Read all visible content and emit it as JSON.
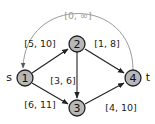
{
  "graph": {
    "nodes": [
      {
        "id": "1",
        "label": "1",
        "x": 25,
        "y": 78,
        "terminal": "s"
      },
      {
        "id": "2",
        "label": "2",
        "x": 77,
        "y": 44
      },
      {
        "id": "3",
        "label": "3",
        "x": 77,
        "y": 108
      },
      {
        "id": "4",
        "label": "4",
        "x": 133,
        "y": 78,
        "terminal": "t"
      }
    ],
    "edges": [
      {
        "from": "1",
        "to": "2",
        "label": "[5, 10]"
      },
      {
        "from": "2",
        "to": "4",
        "label": "[1, 8]"
      },
      {
        "from": "2",
        "to": "3",
        "label": "[3, 6]"
      },
      {
        "from": "1",
        "to": "3",
        "label": "[6, 11]"
      },
      {
        "from": "3",
        "to": "4",
        "label": "[4, 10]"
      },
      {
        "from": "4",
        "to": "1",
        "label": "[0, ∞]",
        "style": "gray-arc"
      }
    ],
    "terminals": {
      "source": "s",
      "sink": "t"
    },
    "colors": {
      "node_fill": "#b8b8b8",
      "edge": "#222222",
      "back_edge": "#9a9a9a"
    }
  }
}
